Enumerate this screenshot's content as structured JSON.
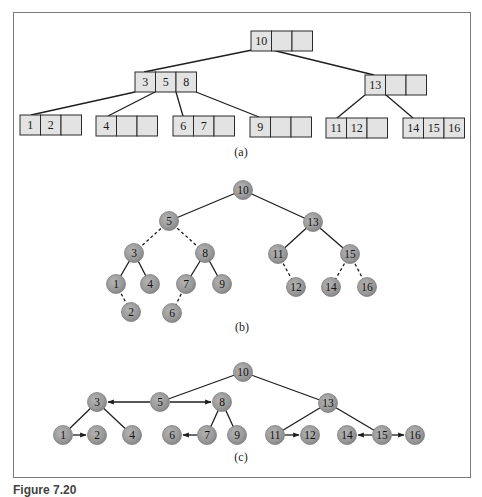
{
  "figure": {
    "caption_partial": "Figure 7.20",
    "panels": [
      {
        "id": "a",
        "label": "(a)",
        "type": "b-tree",
        "nodes": [
          {
            "id": "root",
            "keys": [
              "10",
              "",
              ""
            ],
            "x": 251,
            "y": 31
          },
          {
            "id": "n358",
            "keys": [
              "3",
              "5",
              "8"
            ],
            "x": 135,
            "y": 72
          },
          {
            "id": "n13",
            "keys": [
              "13",
              "",
              ""
            ],
            "x": 365,
            "y": 75
          },
          {
            "id": "n12",
            "keys": [
              "1",
              "2",
              ""
            ],
            "x": 20,
            "y": 115
          },
          {
            "id": "n4",
            "keys": [
              "4",
              "",
              ""
            ],
            "x": 96,
            "y": 116
          },
          {
            "id": "n67",
            "keys": [
              "6",
              "7",
              ""
            ],
            "x": 173,
            "y": 116
          },
          {
            "id": "n9",
            "keys": [
              "9",
              "",
              ""
            ],
            "x": 250,
            "y": 117
          },
          {
            "id": "n1112",
            "keys": [
              "11",
              "12",
              ""
            ],
            "x": 326,
            "y": 118
          },
          {
            "id": "n141516",
            "keys": [
              "14",
              "15",
              "16"
            ],
            "x": 403,
            "y": 118
          }
        ]
      },
      {
        "id": "b",
        "label": "(b)",
        "type": "binary-tree",
        "nodes": [
          "10",
          "5",
          "3",
          "8",
          "1",
          "4",
          "7",
          "9",
          "2",
          "6",
          "13",
          "11",
          "15",
          "12",
          "14",
          "16"
        ],
        "solid_edges": [
          [
            "10",
            "5"
          ],
          [
            "10",
            "13"
          ],
          [
            "3",
            "1"
          ],
          [
            "3",
            "4"
          ],
          [
            "8",
            "7"
          ],
          [
            "8",
            "9"
          ],
          [
            "13",
            "11"
          ],
          [
            "13",
            "15"
          ]
        ],
        "dashed_edges": [
          [
            "5",
            "3"
          ],
          [
            "5",
            "8"
          ],
          [
            "1",
            "2"
          ],
          [
            "7",
            "6"
          ],
          [
            "11",
            "12"
          ],
          [
            "15",
            "14"
          ],
          [
            "15",
            "16"
          ]
        ]
      },
      {
        "id": "c",
        "label": "(c)",
        "type": "tree-with-sibling-links",
        "nodes": [
          "10",
          "3",
          "5",
          "8",
          "1",
          "2",
          "4",
          "6",
          "7",
          "9",
          "13",
          "11",
          "12",
          "14",
          "15",
          "16"
        ],
        "solid_edges": [
          [
            "10",
            "5"
          ],
          [
            "10",
            "13"
          ],
          [
            "3",
            "1"
          ],
          [
            "3",
            "4"
          ],
          [
            "8",
            "7"
          ],
          [
            "8",
            "9"
          ],
          [
            "13",
            "11"
          ],
          [
            "13",
            "15"
          ]
        ],
        "arrow_edges": [
          [
            "5",
            "3"
          ],
          [
            "5",
            "8"
          ],
          [
            "1",
            "2"
          ],
          [
            "7",
            "6"
          ],
          [
            "11",
            "12"
          ],
          [
            "15",
            "14"
          ],
          [
            "15",
            "16"
          ]
        ]
      }
    ]
  },
  "colors": {
    "box_fill": "#e3e3e3",
    "node_fill": "#9a9a9a",
    "line": "#1e1e1e",
    "frame": "#7a7a7a"
  },
  "labels": {
    "a": "(a)",
    "b": "(b)",
    "c": "(c)",
    "r": "10",
    "k3": "3",
    "k5": "5",
    "k8": "8",
    "k13": "13",
    "k1": "1",
    "k2": "2",
    "k4": "4",
    "k6": "6",
    "k7": "7",
    "k9": "9",
    "k11": "11",
    "k12": "12",
    "k14": "14",
    "k15": "15",
    "k16": "16"
  }
}
